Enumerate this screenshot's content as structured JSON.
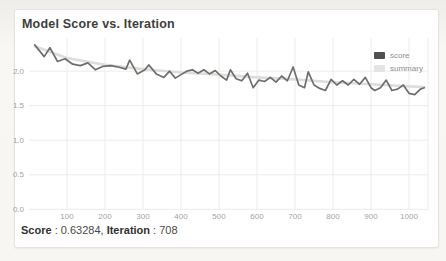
{
  "card": {
    "title": "Model Score vs. Iteration",
    "footer": {
      "score_label": "Score",
      "score_value": "0.63284",
      "iteration_label": "Iteration",
      "iteration_value": "708",
      "separator": " : ",
      "delimiter": ", "
    }
  },
  "colors": {
    "score_line": "#6e6e6c",
    "summary_line": "#dddddb",
    "grid": "#ececea",
    "tick_text": "#a3a3a1",
    "card_background": "#ffffff",
    "page_background": "#f2f1ee"
  },
  "chart_data": {
    "type": "line",
    "title": "Model Score vs. Iteration",
    "xlabel": "Iteration",
    "ylabel": "Score",
    "xlim": [
      0,
      1050
    ],
    "ylim": [
      0,
      2.48
    ],
    "x_ticks": [
      100,
      200,
      300,
      400,
      500,
      600,
      700,
      800,
      900,
      1000
    ],
    "y_ticks": [
      0.0,
      0.5,
      1.0,
      1.5,
      2.0
    ],
    "grid": true,
    "legend_position": "top-right",
    "series": [
      {
        "name": "score",
        "color": "#6e6e6c",
        "x": [
          15,
          40,
          55,
          75,
          95,
          115,
          135,
          155,
          175,
          195,
          215,
          235,
          255,
          265,
          285,
          305,
          315,
          335,
          355,
          370,
          385,
          400,
          415,
          430,
          445,
          460,
          475,
          490,
          505,
          520,
          530,
          545,
          560,
          575,
          590,
          605,
          620,
          635,
          650,
          665,
          680,
          695,
          710,
          725,
          735,
          750,
          765,
          780,
          795,
          810,
          825,
          840,
          855,
          870,
          885,
          900,
          910,
          925,
          940,
          955,
          970,
          985,
          1000,
          1015,
          1030,
          1040
        ],
        "values": [
          2.38,
          2.21,
          2.34,
          2.14,
          2.18,
          2.1,
          2.08,
          2.12,
          2.02,
          2.07,
          2.08,
          2.06,
          2.03,
          2.16,
          1.96,
          2.02,
          2.09,
          1.96,
          1.91,
          2.0,
          1.9,
          1.95,
          2.0,
          2.02,
          1.97,
          2.02,
          1.96,
          2.01,
          1.93,
          1.87,
          2.02,
          1.89,
          1.86,
          1.97,
          1.76,
          1.87,
          1.85,
          1.91,
          1.84,
          1.93,
          1.86,
          2.06,
          1.8,
          1.76,
          1.99,
          1.8,
          1.75,
          1.72,
          1.88,
          1.8,
          1.86,
          1.8,
          1.88,
          1.81,
          1.91,
          1.76,
          1.72,
          1.76,
          1.87,
          1.72,
          1.74,
          1.8,
          1.68,
          1.66,
          1.74,
          1.76
        ]
      },
      {
        "name": "summary",
        "color": "#dddddb",
        "x": [
          15,
          100,
          200,
          300,
          400,
          500,
          600,
          700,
          800,
          900,
          1000,
          1040
        ],
        "values": [
          2.36,
          2.19,
          2.09,
          2.03,
          1.98,
          1.95,
          1.91,
          1.88,
          1.84,
          1.81,
          1.78,
          1.77
        ]
      }
    ]
  }
}
